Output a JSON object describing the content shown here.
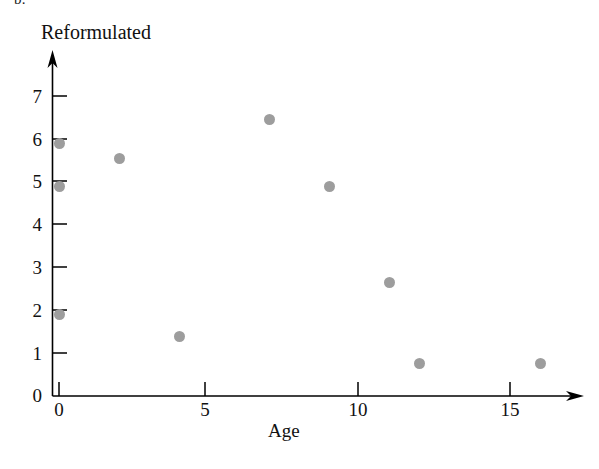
{
  "figure": {
    "part_label": "b.",
    "ylabel": "Reformulated",
    "xlabel": "Age"
  },
  "axes": {
    "y_ticks": [
      "0",
      "1",
      "2",
      "3",
      "4",
      "5",
      "6",
      "7"
    ],
    "x_ticks": [
      "0",
      "5",
      "10",
      "15"
    ],
    "dot_color": "#9d9d9d",
    "axis_color": "#000000"
  },
  "chart_data": {
    "type": "scatter",
    "title": "",
    "subtitle": "",
    "xlabel": "Age",
    "ylabel": "Reformulated",
    "xlim": [
      0,
      18
    ],
    "ylim": [
      0,
      7.6
    ],
    "xticks": [
      0,
      5,
      10,
      15
    ],
    "yticks": [
      0,
      1,
      2,
      3,
      4,
      5,
      6,
      7
    ],
    "grid": false,
    "legend": null,
    "annotations": [
      "b."
    ],
    "marker": {
      "shape": "circle",
      "color": "#9d9d9d",
      "size": 11
    },
    "points": [
      {
        "x": 0,
        "y": 5.9
      },
      {
        "x": 0,
        "y": 4.9
      },
      {
        "x": 0,
        "y": 1.9
      },
      {
        "x": 2,
        "y": 5.55
      },
      {
        "x": 4,
        "y": 1.4
      },
      {
        "x": 7,
        "y": 6.45
      },
      {
        "x": 9,
        "y": 4.9
      },
      {
        "x": 11,
        "y": 2.65
      },
      {
        "x": 12,
        "y": 0.75
      },
      {
        "x": 16,
        "y": 0.75
      }
    ],
    "x": [
      0,
      0,
      0,
      2,
      4,
      7,
      9,
      11,
      12,
      16
    ],
    "values": [
      5.9,
      4.9,
      1.9,
      5.55,
      1.4,
      6.45,
      4.9,
      2.65,
      0.75,
      0.75
    ]
  }
}
